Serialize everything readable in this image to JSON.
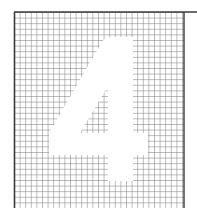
{
  "figure": {
    "glyph": "4",
    "grid": {
      "line_color": "#6e6e6e",
      "border_color": "#3a3a3a",
      "background": "#ffffff",
      "cell_size_px": 5.6
    },
    "numeral_color": "#ffffff"
  }
}
